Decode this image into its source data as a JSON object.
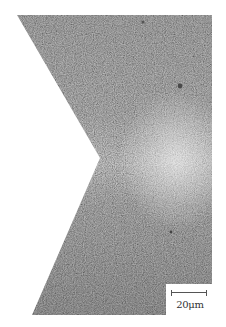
{
  "figure": {
    "scale_bar": {
      "label": "20μm"
    },
    "colors": {
      "background": "#ffffff",
      "specimen_dark": "#9a9a9a",
      "specimen_light": "#e6e6e6"
    }
  }
}
